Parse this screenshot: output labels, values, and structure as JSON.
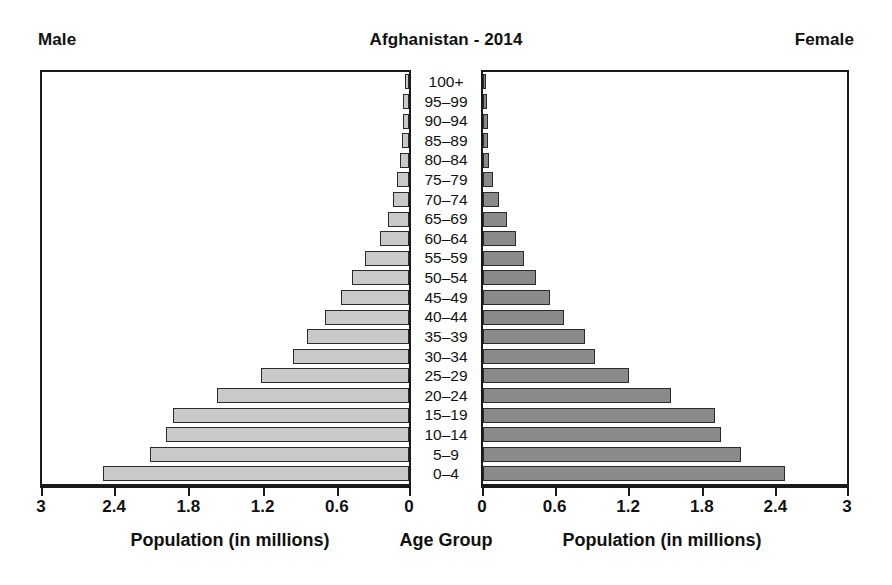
{
  "header": {
    "left_label": "Male",
    "title": "Afghanistan - 2014",
    "right_label": "Female"
  },
  "axis_captions": {
    "left": "Population (in millions)",
    "center": "Age Group",
    "right": "Population (in millions)"
  },
  "colors": {
    "male_bar": "#c9c9c9",
    "female_bar": "#8a8a8a",
    "axis": "#1a1a1a",
    "text": "#111111",
    "background": "#ffffff"
  },
  "chart_data": {
    "type": "bar",
    "subtype": "population-pyramid",
    "title": "Afghanistan - 2014",
    "xlabel": "Population (in millions)",
    "ylabel": "Age Group",
    "xlim_left": [
      3,
      0
    ],
    "xlim_right": [
      0,
      3
    ],
    "grid": false,
    "legend_position": "none",
    "left_tick_labels": [
      "3",
      "2.4",
      "1.8",
      "1.2",
      "0.6",
      "0"
    ],
    "left_tick_values": [
      3,
      2.4,
      1.8,
      1.2,
      0.6,
      0
    ],
    "right_tick_labels": [
      "0",
      "0.6",
      "1.2",
      "1.8",
      "2.4",
      "3"
    ],
    "right_tick_values": [
      0,
      0.6,
      1.2,
      1.8,
      2.4,
      3
    ],
    "categories": [
      "100+",
      "95–99",
      "90–94",
      "85–89",
      "80–84",
      "75–79",
      "70–74",
      "65–69",
      "60–64",
      "55–59",
      "50–54",
      "45–49",
      "40–44",
      "35–39",
      "30–34",
      "25–29",
      "20–24",
      "15–19",
      "10–14",
      "5–9",
      "0–4"
    ],
    "series": [
      {
        "name": "Male",
        "side": "left",
        "color": "#c9c9c9",
        "values": [
          0.03,
          0.05,
          0.05,
          0.06,
          0.07,
          0.1,
          0.13,
          0.17,
          0.24,
          0.36,
          0.47,
          0.56,
          0.69,
          0.83,
          0.95,
          1.21,
          1.57,
          1.93,
          1.99,
          2.12,
          2.5
        ]
      },
      {
        "name": "Female",
        "side": "right",
        "color": "#8a8a8a",
        "values": [
          0.02,
          0.03,
          0.04,
          0.04,
          0.05,
          0.08,
          0.13,
          0.2,
          0.27,
          0.34,
          0.44,
          0.55,
          0.67,
          0.84,
          0.92,
          1.2,
          1.55,
          1.91,
          1.96,
          2.13,
          2.49
        ]
      }
    ]
  }
}
